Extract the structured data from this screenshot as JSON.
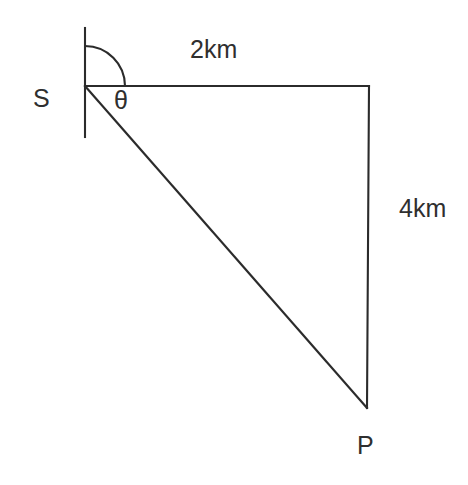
{
  "diagram": {
    "type": "right-triangle-geometry",
    "title": "",
    "background_color": "#ffffff",
    "stroke_color": "#2b2b2b",
    "text_color": "#2f2f2f",
    "vertices": [
      {
        "id": "S",
        "label": "S",
        "x": 85,
        "y": 86,
        "label_x": 33,
        "label_y": 86
      },
      {
        "id": "Q",
        "label": "",
        "x": 369,
        "y": 86,
        "label_x": 0,
        "label_y": 0
      },
      {
        "id": "P",
        "label": "P",
        "x": 367,
        "y": 407,
        "label_x": 357,
        "label_y": 433
      }
    ],
    "segments": [
      {
        "id": "reference-vertical",
        "from_x": 85,
        "from_y": 28,
        "to_x": 85,
        "to_y": 137,
        "label": ""
      },
      {
        "id": "top-side",
        "from_x": 85,
        "from_y": 86,
        "to_x": 369,
        "to_y": 86,
        "label": "2km"
      },
      {
        "id": "right-side",
        "from_x": 369,
        "from_y": 86,
        "to_x": 367,
        "to_y": 407,
        "label": "4km"
      },
      {
        "id": "hypotenuse",
        "from_x": 85,
        "from_y": 86,
        "to_x": 367,
        "to_y": 407,
        "label": ""
      }
    ],
    "angle_arc": {
      "id": "bearing-arc",
      "label": "θ",
      "center_x": 85,
      "center_y": 86,
      "radius": 40,
      "start_deg": 270,
      "end_deg": 0,
      "label_x": 114,
      "label_y": 88
    },
    "labels": {
      "vertex_s": "S",
      "vertex_p": "P",
      "angle_theta": "θ",
      "top_side_measure": "2km",
      "right_side_measure": "4km"
    }
  }
}
